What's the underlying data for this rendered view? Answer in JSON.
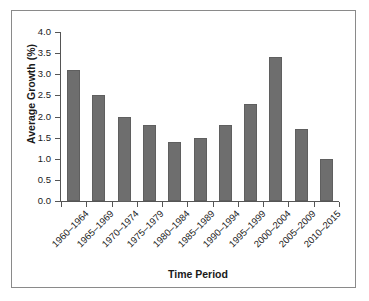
{
  "chart_data": {
    "type": "bar",
    "title": "",
    "xlabel": "Time Period",
    "ylabel": "Average Growth (%)",
    "categories": [
      "1960–1964",
      "1965–1969",
      "1970–1974",
      "1975–1979",
      "1980–1984",
      "1985–1989",
      "1990–1994",
      "1995–1999",
      "2000–2004",
      "2005–2009",
      "2010–2015"
    ],
    "values": [
      3.1,
      2.5,
      2.0,
      1.8,
      1.4,
      1.5,
      1.8,
      2.3,
      3.4,
      1.7,
      1.0
    ],
    "ylim": [
      0.0,
      4.0
    ],
    "ytick_labels": [
      "0.0",
      "0.5",
      "1.0",
      "1.5",
      "2.0",
      "2.5",
      "3.0",
      "3.5",
      "4.0"
    ],
    "ytick_values": [
      0.0,
      0.5,
      1.0,
      1.5,
      2.0,
      2.5,
      3.0,
      3.5,
      4.0
    ],
    "grid": false,
    "legend": false,
    "bar_color": "#6e6e6e",
    "axis_color": "#555555",
    "frame_color": "#8a8a8a",
    "background_color": "#ffffff"
  }
}
